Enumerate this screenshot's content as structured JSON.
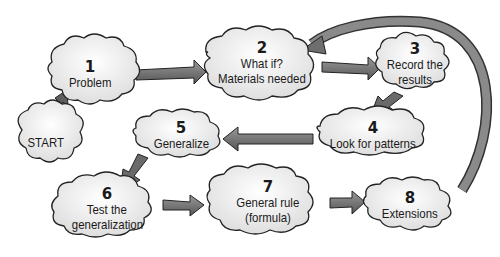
{
  "diagram": {
    "title": "",
    "nodes": [
      {
        "id": "start",
        "number": "",
        "label": "START"
      },
      {
        "id": "n1",
        "number": "1",
        "label": "Problem"
      },
      {
        "id": "n2",
        "number": "2",
        "label_line1": "What if?",
        "label_line2": "Materials needed"
      },
      {
        "id": "n3",
        "number": "3",
        "label_line1": "Record the",
        "label_line2": "results"
      },
      {
        "id": "n4",
        "number": "4",
        "label": "Look for patterns"
      },
      {
        "id": "n5",
        "number": "5",
        "label": "Generalize"
      },
      {
        "id": "n6",
        "number": "6",
        "label_line1": "Test the",
        "label_line2": "generalization"
      },
      {
        "id": "n7",
        "number": "7",
        "label_line1": "General rule",
        "label_line2": "(formula)"
      },
      {
        "id": "n8",
        "number": "8",
        "label": "Extensions"
      }
    ],
    "edges": [
      {
        "from": "start",
        "to": "n1"
      },
      {
        "from": "n1",
        "to": "n2"
      },
      {
        "from": "n2",
        "to": "n3"
      },
      {
        "from": "n3",
        "to": "n4"
      },
      {
        "from": "n4",
        "to": "n5"
      },
      {
        "from": "n5",
        "to": "n6"
      },
      {
        "from": "n6",
        "to": "n7"
      },
      {
        "from": "n7",
        "to": "n8"
      },
      {
        "from": "n8",
        "to": "n2"
      }
    ],
    "colors": {
      "cloud_fill": "#eeeeee",
      "cloud_stroke": "#222222",
      "arrow_fill": "#6e6e6e",
      "text": "#1a1a1a"
    }
  }
}
